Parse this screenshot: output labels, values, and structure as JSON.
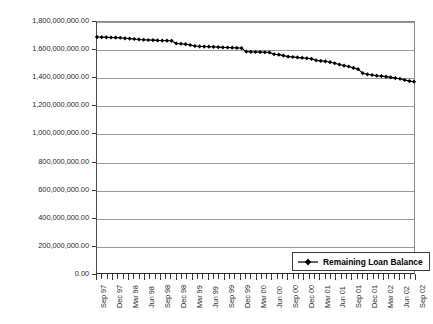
{
  "chart_data": {
    "type": "line",
    "title": "",
    "xlabel": "",
    "ylabel": "",
    "ylim": [
      0,
      1800000000
    ],
    "ytick_step": 200000000,
    "grid": true,
    "legend_position": "bottom-right",
    "ytick_labels": [
      "1,800,000,000.00",
      "1,600,000,000.00",
      "1,400,000,000.00",
      "1,200,000,000.00",
      "1,000,000,000.00",
      "800,000,000.00",
      "600,000,000.00",
      "400,000,000.00",
      "200,000,000.00",
      "0.00"
    ],
    "ytick_values": [
      1800000000,
      1600000000,
      1400000000,
      1200000000,
      1000000000,
      800000000,
      600000000,
      400000000,
      200000000,
      0
    ],
    "xtick_labels": [
      "Sep 97",
      "Dec 97",
      "Mar 98",
      "Jun 98",
      "Sep 98",
      "Dec 98",
      "Mar 99",
      "Jun 99",
      "Sep 99",
      "Dec 99",
      "Mar 00",
      "Jun 00",
      "Sep 00",
      "Dec 00",
      "Mar 01",
      "Jun 01",
      "Sep 01",
      "Dec 01",
      "Mar 02",
      "Jun 02",
      "Sep 02"
    ],
    "x_minor_ticks_per_label": 3,
    "series": [
      {
        "name": "Remaining Loan Balance",
        "color": "#000000",
        "marker": "diamond",
        "values": [
          1692000000,
          1691000000,
          1690000000,
          1689000000,
          1688000000,
          1687000000,
          1683000000,
          1681000000,
          1678000000,
          1675000000,
          1673000000,
          1671000000,
          1670000000,
          1668000000,
          1667000000,
          1666000000,
          1665000000,
          1646000000,
          1644000000,
          1641000000,
          1635000000,
          1628000000,
          1625000000,
          1624000000,
          1623000000,
          1622000000,
          1620000000,
          1618000000,
          1617000000,
          1616000000,
          1614000000,
          1613000000,
          1588000000,
          1586000000,
          1585000000,
          1584000000,
          1583000000,
          1582000000,
          1569000000,
          1566000000,
          1559000000,
          1552000000,
          1549000000,
          1546000000,
          1543000000,
          1540000000,
          1536000000,
          1525000000,
          1521000000,
          1518000000,
          1512000000,
          1504000000,
          1495000000,
          1487000000,
          1481000000,
          1471000000,
          1462000000,
          1433000000,
          1425000000,
          1420000000,
          1415000000,
          1412000000,
          1408000000,
          1403000000,
          1398000000,
          1393000000,
          1384000000,
          1376000000,
          1372000000
        ]
      }
    ]
  },
  "legend": {
    "entries": [
      {
        "label": "Remaining Loan Balance"
      }
    ]
  }
}
